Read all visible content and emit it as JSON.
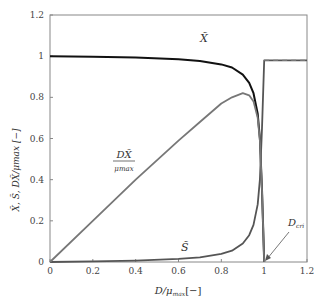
{
  "chart_data": {
    "type": "line",
    "title": "",
    "xlabel": "D/μmax [−]",
    "ylabel": "X̃, S̃, DX̃/μmax [−]",
    "xlim": [
      0,
      1.2
    ],
    "ylim": [
      0,
      1.2
    ],
    "xticks": [
      "0",
      "0.2",
      "0.4",
      "0.6",
      "0.8",
      "1",
      "1.2"
    ],
    "yticks": [
      "0",
      "0.2",
      "0.4",
      "0.6",
      "0.8",
      "1",
      "1.2"
    ],
    "grid": false,
    "legend": "none (inline labels)",
    "series": [
      {
        "name": "X̃",
        "color": "#111111",
        "x": [
          0,
          0.2,
          0.4,
          0.6,
          0.7,
          0.8,
          0.85,
          0.9,
          0.93,
          0.95,
          0.97,
          0.98,
          0.99,
          1.0
        ],
        "y": [
          1.0,
          0.997,
          0.993,
          0.985,
          0.977,
          0.96,
          0.945,
          0.91,
          0.87,
          0.82,
          0.72,
          0.6,
          0.35,
          0.0
        ]
      },
      {
        "name": "S̃",
        "color": "#555555",
        "x": [
          0,
          0.2,
          0.4,
          0.6,
          0.7,
          0.8,
          0.85,
          0.9,
          0.93,
          0.95,
          0.97,
          0.98,
          0.99,
          1.0,
          1.0,
          1.2
        ],
        "y": [
          0,
          0.003,
          0.007,
          0.015,
          0.023,
          0.04,
          0.055,
          0.09,
          0.13,
          0.18,
          0.28,
          0.4,
          0.65,
          0.98,
          0.98,
          0.98
        ]
      },
      {
        "name": "DX̃/μmax",
        "color": "#777777",
        "x": [
          0,
          0.2,
          0.4,
          0.6,
          0.7,
          0.8,
          0.85,
          0.9,
          0.93,
          0.95,
          0.97,
          0.98,
          0.99,
          1.0
        ],
        "y": [
          0,
          0.2,
          0.4,
          0.59,
          0.68,
          0.77,
          0.8,
          0.82,
          0.81,
          0.78,
          0.7,
          0.59,
          0.35,
          0.0
        ]
      }
    ],
    "dashed_line": {
      "y": 0.98,
      "x_from": 1.0,
      "x_to": 1.2
    },
    "annotations": [
      {
        "text": "X̃",
        "x": 0.72,
        "y": 1.03
      },
      {
        "text": "DX̃/μmax",
        "x": 0.38,
        "y": 0.5
      },
      {
        "text": "S̃",
        "x": 0.61,
        "y": 0.04
      },
      {
        "text": "Dcri",
        "x": 1.08,
        "y": 0.14,
        "arrow_to": [
          1.0,
          0.0
        ]
      }
    ]
  },
  "labels": {
    "xlabel_main": "D/μ",
    "xlabel_sub": "max",
    "xlabel_unit": "[−]",
    "ylabel": "X̃, S̃, DX̃/μmax [−]",
    "x_label": "X̃",
    "s_label": "S̃",
    "dx_num": "DX̃",
    "dx_den": "μmax",
    "dcri_main": "D",
    "dcri_sub": "cri"
  }
}
